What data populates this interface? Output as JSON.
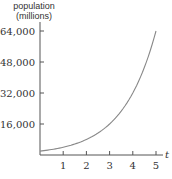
{
  "chart_data": {
    "type": "line",
    "title": "",
    "ylabel_line1": "population",
    "ylabel_line2": "(millions)",
    "xlabel": "t",
    "x_ticks": [
      "1",
      "2",
      "3",
      "4",
      "5"
    ],
    "y_ticks": [
      "16,000",
      "32,000",
      "48,000",
      "64,000"
    ],
    "xlim": [
      0,
      5.3
    ],
    "ylim": [
      0,
      70000
    ],
    "grid": false,
    "series": [
      {
        "name": "population",
        "x": [
          0,
          1,
          2,
          3,
          4,
          5
        ],
        "values": [
          2000,
          4000,
          8000,
          16000,
          32000,
          64000
        ]
      }
    ],
    "colors": {
      "axis": "#555555",
      "curve": "#888888"
    }
  }
}
